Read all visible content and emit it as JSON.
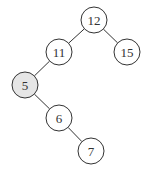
{
  "diagram": {
    "type": "binary-search-tree",
    "nodes": [
      {
        "id": "n12",
        "label": "12",
        "x": 94,
        "y": 20,
        "highlighted": false
      },
      {
        "id": "n11",
        "label": "11",
        "x": 59,
        "y": 52,
        "highlighted": false
      },
      {
        "id": "n15",
        "label": "15",
        "x": 127,
        "y": 52,
        "highlighted": false
      },
      {
        "id": "n5",
        "label": "5",
        "x": 25,
        "y": 85,
        "highlighted": true
      },
      {
        "id": "n6",
        "label": "6",
        "x": 59,
        "y": 118,
        "highlighted": false
      },
      {
        "id": "n7",
        "label": "7",
        "x": 91,
        "y": 151,
        "highlighted": false
      }
    ],
    "edges": [
      {
        "from": "n12",
        "to": "n11"
      },
      {
        "from": "n12",
        "to": "n15"
      },
      {
        "from": "n11",
        "to": "n5"
      },
      {
        "from": "n5",
        "to": "n6"
      },
      {
        "from": "n6",
        "to": "n7"
      }
    ],
    "colors": {
      "node_fill": "#ffffff",
      "highlight_fill": "#e6e6e6",
      "stroke": "#333333"
    },
    "radius": 13
  }
}
